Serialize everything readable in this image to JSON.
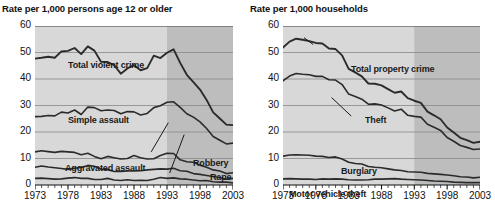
{
  "figure": {
    "background_color": "#ffffff",
    "band_color_light": "#d8d8d8",
    "band_color_dark": "#bdbdbd",
    "line_color": "#2b2b2b",
    "gridline_color": "#888888"
  },
  "panels": [
    {
      "id": "violent-crime",
      "title": "Rate per 1,000 persons age 12 or older",
      "series_labels": [
        {
          "text": "Total violent crime",
          "x": 33,
          "y": 34
        },
        {
          "text": "Simple assault",
          "x": 33,
          "y": 89
        },
        {
          "text": "Aggravated assault",
          "x": 30,
          "y": 137
        },
        {
          "text": "Robbery",
          "x": 158,
          "y": 132
        },
        {
          "text": "Rape",
          "x": 175,
          "y": 146
        }
      ]
    },
    {
      "id": "property-crime",
      "title": "Rate per 1,000 households",
      "series_labels": [
        {
          "text": "Total property crime",
          "x": 68,
          "y": 38
        },
        {
          "text": "Theft",
          "x": 82,
          "y": 89
        },
        {
          "text": "Burglary",
          "x": 58,
          "y": 140
        },
        {
          "text": "Motor vehicle theft",
          "x": 6,
          "y": 163
        }
      ]
    }
  ],
  "chart_data": [
    {
      "type": "line",
      "id": "violent-crime",
      "title": "Rate per 1,000 persons age 12 or older",
      "xlabel": "",
      "ylabel": "Rate per 1,000 persons age 12 or older",
      "xlim": [
        1973,
        2003
      ],
      "ylim": [
        0,
        60
      ],
      "yticks": [
        0,
        10,
        20,
        30,
        40,
        50,
        60
      ],
      "xticks": [
        1973,
        1978,
        1983,
        1988,
        1993,
        1998,
        2003
      ],
      "xtick_minor_interval": 1,
      "grid": true,
      "legend": "inline-labels",
      "shaded_band": {
        "from": 1993,
        "to": 2003,
        "note": "darker shading"
      },
      "x": [
        1973,
        1974,
        1975,
        1976,
        1977,
        1978,
        1979,
        1980,
        1981,
        1982,
        1983,
        1984,
        1985,
        1986,
        1987,
        1988,
        1989,
        1990,
        1991,
        1992,
        1993,
        1994,
        1995,
        1996,
        1997,
        1998,
        1999,
        2000,
        2001,
        2002,
        2003
      ],
      "series": [
        {
          "name": "Total violent crime",
          "values": [
            47.7,
            48.0,
            48.4,
            48.0,
            50.4,
            50.6,
            51.7,
            49.4,
            52.3,
            50.7,
            46.5,
            46.4,
            45.2,
            42.0,
            44.0,
            45.2,
            43.3,
            44.1,
            48.8,
            47.9,
            49.9,
            51.2,
            46.1,
            41.6,
            38.8,
            36.0,
            32.1,
            27.4,
            25.1,
            22.8,
            22.6
          ]
        },
        {
          "name": "Simple assault",
          "values": [
            25.8,
            25.9,
            26.2,
            26.1,
            27.5,
            27.2,
            28.3,
            26.6,
            29.4,
            29.2,
            28.0,
            28.3,
            28.1,
            26.9,
            27.7,
            27.6,
            26.4,
            27.0,
            29.2,
            29.9,
            31.2,
            31.4,
            29.3,
            26.9,
            25.6,
            23.8,
            21.3,
            18.3,
            16.9,
            15.5,
            15.8
          ]
        },
        {
          "name": "Aggravated assault",
          "values": [
            12.5,
            12.9,
            12.6,
            12.3,
            12.7,
            12.5,
            12.3,
            11.4,
            12.0,
            10.8,
            9.9,
            10.8,
            10.3,
            9.8,
            10.0,
            11.1,
            10.3,
            9.8,
            9.9,
            11.1,
            12.0,
            11.9,
            9.5,
            8.8,
            8.6,
            7.5,
            6.7,
            5.7,
            5.3,
            4.3,
            4.6
          ]
        },
        {
          "name": "Robbery",
          "values": [
            6.7,
            7.2,
            6.8,
            6.5,
            6.2,
            5.9,
            6.3,
            6.6,
            7.4,
            7.1,
            6.0,
            5.8,
            5.1,
            5.1,
            5.3,
            5.3,
            5.4,
            5.7,
            5.9,
            6.1,
            6.0,
            6.3,
            5.4,
            5.2,
            4.3,
            4.0,
            3.6,
            3.2,
            2.8,
            2.2,
            2.5
          ]
        },
        {
          "name": "Rape",
          "values": [
            2.5,
            2.6,
            2.4,
            2.2,
            2.3,
            2.6,
            2.8,
            2.5,
            2.5,
            2.1,
            2.1,
            2.5,
            1.9,
            1.7,
            2.0,
            1.7,
            1.8,
            1.7,
            2.2,
            2.8,
            2.5,
            2.7,
            2.3,
            2.2,
            1.9,
            1.6,
            1.7,
            1.2,
            1.1,
            1.1,
            0.8
          ]
        }
      ]
    },
    {
      "type": "line",
      "id": "property-crime",
      "title": "Rate per 1,000 households",
      "xlabel": "",
      "ylabel": "Rate per 1,000 households",
      "xlim": [
        1973,
        2003
      ],
      "ylim": [
        0,
        60
      ],
      "yticks": [
        0,
        10,
        20,
        30,
        40,
        50,
        60
      ],
      "xticks": [
        1973,
        1978,
        1983,
        1988,
        1993,
        1998,
        2003
      ],
      "xtick_minor_interval": 1,
      "grid": true,
      "legend": "inline-labels",
      "shaded_band": {
        "from": 1993,
        "to": 2003,
        "note": "darker shading"
      },
      "x": [
        1973,
        1974,
        1975,
        1976,
        1977,
        1978,
        1979,
        1980,
        1981,
        1982,
        1983,
        1984,
        1985,
        1986,
        1987,
        1988,
        1989,
        1990,
        1991,
        1992,
        1993,
        1994,
        1995,
        1996,
        1997,
        1998,
        1999,
        2000,
        2001,
        2002,
        2003
      ],
      "series": [
        {
          "name": "Total property crime",
          "values": [
            51.9,
            54.1,
            55.2,
            54.8,
            54.3,
            53.6,
            53.4,
            51.5,
            51.3,
            48.9,
            43.8,
            42.5,
            41.0,
            38.3,
            38.2,
            37.6,
            36.2,
            34.8,
            35.3,
            32.8,
            31.8,
            31.0,
            27.7,
            26.3,
            24.8,
            21.7,
            19.8,
            17.8,
            16.9,
            15.9,
            16.3
          ]
        },
        {
          "name": "Theft",
          "values": [
            39.3,
            41.1,
            42.1,
            41.8,
            41.6,
            41.0,
            41.0,
            39.7,
            39.6,
            37.9,
            34.3,
            33.4,
            32.4,
            30.5,
            30.6,
            30.2,
            29.1,
            27.9,
            28.6,
            26.3,
            25.9,
            25.6,
            22.9,
            21.8,
            20.6,
            17.9,
            16.5,
            14.9,
            14.2,
            13.4,
            13.6
          ]
        },
        {
          "name": "Burglary",
          "values": [
            10.9,
            11.3,
            11.4,
            11.3,
            11.2,
            10.9,
            10.8,
            10.4,
            10.6,
            9.8,
            8.6,
            8.1,
            7.9,
            7.0,
            6.7,
            6.5,
            6.1,
            5.7,
            5.5,
            5.0,
            4.9,
            4.8,
            4.4,
            4.2,
            4.0,
            3.8,
            3.5,
            3.1,
            3.0,
            2.7,
            2.9
          ]
        },
        {
          "name": "Motor vehicle theft",
          "values": [
            2.3,
            2.4,
            2.3,
            2.2,
            2.2,
            2.1,
            2.3,
            2.2,
            2.3,
            2.2,
            2.0,
            1.9,
            1.9,
            2.0,
            2.2,
            2.2,
            2.3,
            2.4,
            2.2,
            2.1,
            2.0,
            1.9,
            1.7,
            1.5,
            1.4,
            1.3,
            1.1,
            1.0,
            0.9,
            0.9,
            0.9
          ]
        }
      ]
    }
  ]
}
